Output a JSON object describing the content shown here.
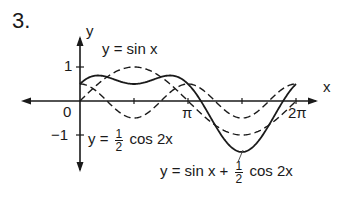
{
  "problem_number": "3.",
  "chart_data": {
    "type": "line",
    "title": "",
    "xlabel": "x",
    "ylabel": "y",
    "x_ticks": [
      "π",
      "2π"
    ],
    "y_ticks": [
      "1",
      "0",
      "−1"
    ],
    "xlim": [
      0,
      6.2832
    ],
    "ylim": [
      -1.5,
      1.5
    ],
    "grid": false,
    "series": [
      {
        "name": "y = sin x",
        "style": "dashed",
        "function": "sin(x)",
        "x": [
          0,
          0.785,
          1.571,
          2.356,
          3.142,
          3.927,
          4.712,
          5.498,
          6.283
        ],
        "y": [
          0,
          0.707,
          1,
          0.707,
          0,
          -0.707,
          -1,
          -0.707,
          0
        ]
      },
      {
        "name": "y = 1/2 cos 2x",
        "style": "dashed",
        "function": "0.5*cos(2x)",
        "x": [
          0,
          0.785,
          1.571,
          2.356,
          3.142,
          3.927,
          4.712,
          5.498,
          6.283
        ],
        "y": [
          0.5,
          0,
          -0.5,
          0,
          0.5,
          0,
          -0.5,
          0,
          0.5
        ]
      },
      {
        "name": "y = sin x + 1/2 cos 2x",
        "style": "solid",
        "function": "sin(x)+0.5*cos(2x)",
        "x": [
          0,
          0.785,
          1.571,
          2.356,
          3.142,
          3.927,
          4.712,
          5.498,
          6.283
        ],
        "y": [
          0.5,
          0.707,
          0.5,
          0.707,
          0.5,
          -0.707,
          -1.5,
          -0.707,
          0.5
        ]
      }
    ]
  },
  "labels": {
    "y_axis": "y",
    "x_axis": "x",
    "tick_one": "1",
    "tick_zero": "0",
    "tick_neg_one": "−1",
    "tick_pi": "π",
    "tick_two_pi": "2π",
    "sin_label": "y = sin x",
    "cos_label_prefix": "y =",
    "cos_label_num": "1",
    "cos_label_den": "2",
    "cos_label_suffix": "cos 2x",
    "sum_label_prefix": "y = sin x +",
    "sum_label_num": "1",
    "sum_label_den": "2",
    "sum_label_suffix": "cos 2x"
  }
}
